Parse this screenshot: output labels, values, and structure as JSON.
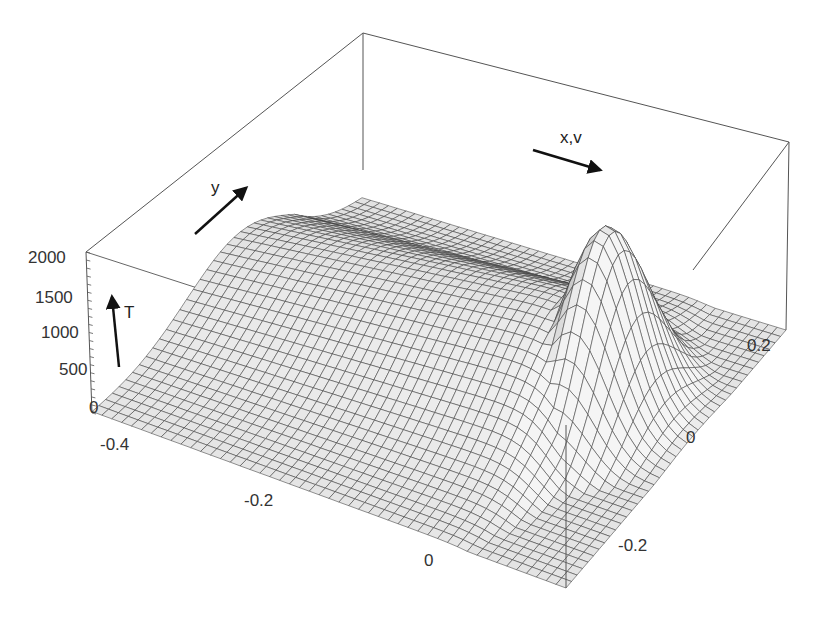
{
  "chart_data": {
    "type": "surface3d",
    "title": "",
    "zlabel": "T",
    "xlabel": "x,v",
    "ylabel": "y",
    "z_ticks": [
      "0",
      "500",
      "1000",
      "1500",
      "2000"
    ],
    "zlim": [
      0,
      2000
    ],
    "x_ticks": [
      "-0.4",
      "-0.2",
      "0"
    ],
    "y_ticks": [
      "-0.2",
      "0",
      "0.2"
    ],
    "xlim": [
      -0.45,
      0.1
    ],
    "ylim": [
      -0.3,
      0.3
    ],
    "surface": {
      "description": "Temperature field: Gaussian peak of ~1900 at x≈0, y≈0.05 with a trailing ridge/plateau toward negative x that decays to ~0 at edges",
      "peak": {
        "x": 0.0,
        "y": 0.05,
        "T": 1900
      },
      "grid_resolution": [
        48,
        40
      ],
      "fill": "#e4e4e4",
      "line": "#3a3a3a"
    },
    "box_color": "#555555"
  },
  "labels": {
    "z_ticks": [
      "0",
      "500",
      "1000",
      "1500",
      "2000"
    ],
    "x_ticks": [
      "-0.4",
      "-0.2",
      "0"
    ],
    "y_ticks": [
      "-0.2",
      "0",
      "0.2"
    ],
    "t_axis": "T",
    "y_axis": "y",
    "x_axis": "x,v"
  }
}
